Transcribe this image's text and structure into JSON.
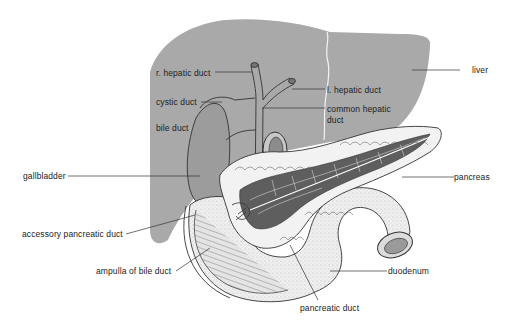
{
  "diagram": {
    "colors": {
      "liver_fill": "#a9a9a9",
      "gallbladder_fill": "#9c9c9c",
      "pancreas_fill": "#f2f2f2",
      "pancreas_lobule_dark": "#5e5e5e",
      "duodenum_fill": "#ededed",
      "line": "#2a2a2a",
      "background": "#ffffff"
    },
    "labels": [
      {
        "id": "r-hepatic-duct",
        "text": "r. hepatic duct"
      },
      {
        "id": "cystic-duct",
        "text": "cystic duct"
      },
      {
        "id": "bile-duct",
        "text": "bile duct"
      },
      {
        "id": "l-hepatic-duct",
        "text": "l. hepatic duct"
      },
      {
        "id": "common-hepatic-duct-1",
        "text": "common hepatic"
      },
      {
        "id": "common-hepatic-duct-2",
        "text": "duct"
      },
      {
        "id": "liver",
        "text": "liver"
      },
      {
        "id": "gallbladder",
        "text": "gallbladder"
      },
      {
        "id": "pancreas",
        "text": "pancreas"
      },
      {
        "id": "accessory-pancreatic-duct",
        "text": "accessory pancreatic duct"
      },
      {
        "id": "ampulla-of-bile-duct",
        "text": "ampulla of bile duct"
      },
      {
        "id": "duodenum",
        "text": "duodenum"
      },
      {
        "id": "pancreatic-duct",
        "text": "pancreatic duct"
      }
    ]
  }
}
